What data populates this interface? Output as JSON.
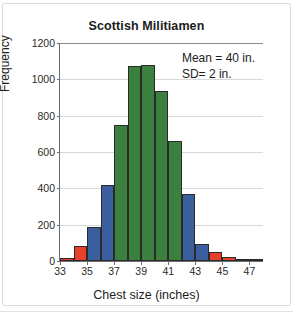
{
  "chart_data": {
    "type": "bar",
    "title": "Scottish Militiamen",
    "xlabel": "Chest size (inches)",
    "ylabel": "Frequency",
    "ylim": [
      0,
      1200
    ],
    "xlim": [
      33,
      48
    ],
    "grid": true,
    "legend": "none",
    "ytick_labels": [
      "0",
      "200",
      "400",
      "600",
      "800",
      "1000",
      "1200"
    ],
    "ytick_values": [
      0,
      200,
      400,
      600,
      800,
      1000,
      1200
    ],
    "xtick_labels": [
      "33",
      "35",
      "37",
      "39",
      "41",
      "43",
      "45",
      "47"
    ],
    "xtick_values": [
      33,
      35,
      37,
      39,
      41,
      43,
      45,
      47
    ],
    "bin_width": 1,
    "categories": [
      "33-34",
      "34-35",
      "35-36",
      "36-37",
      "37-38",
      "38-39",
      "39-40",
      "40-41",
      "41-42",
      "42-43",
      "43-44",
      "44-45",
      "45-46",
      "46-47",
      "47-48"
    ],
    "bin_starts": [
      33,
      34,
      35,
      36,
      37,
      38,
      39,
      40,
      41,
      42,
      43,
      44,
      45,
      46,
      47
    ],
    "values": [
      18,
      81,
      185,
      420,
      749,
      1073,
      1079,
      934,
      658,
      370,
      92,
      50,
      21,
      4,
      1
    ],
    "bar_colors": [
      "#E8402A",
      "#E8402A",
      "#3A5E9E",
      "#3A5E9E",
      "#3C8040",
      "#3C8040",
      "#3C8040",
      "#3C8040",
      "#3C8040",
      "#3A5E9E",
      "#3A5E9E",
      "#E8402A",
      "#E8402A",
      "#E8402A",
      "#E8402A"
    ],
    "annotations": [
      "Mean  =  40 in.",
      "SD=  2 in."
    ]
  },
  "colors": {
    "green": "#3C8040",
    "blue": "#3A5E9E",
    "red": "#E8402A",
    "axis": "#6E6E6E",
    "grid": "#D8D8D8",
    "text": "#1C1C1C",
    "card_border": "#DCDCDC"
  },
  "annotation": {
    "mean_text": "Mean  =  40 in.",
    "sd_text": "SD=  2 in."
  }
}
